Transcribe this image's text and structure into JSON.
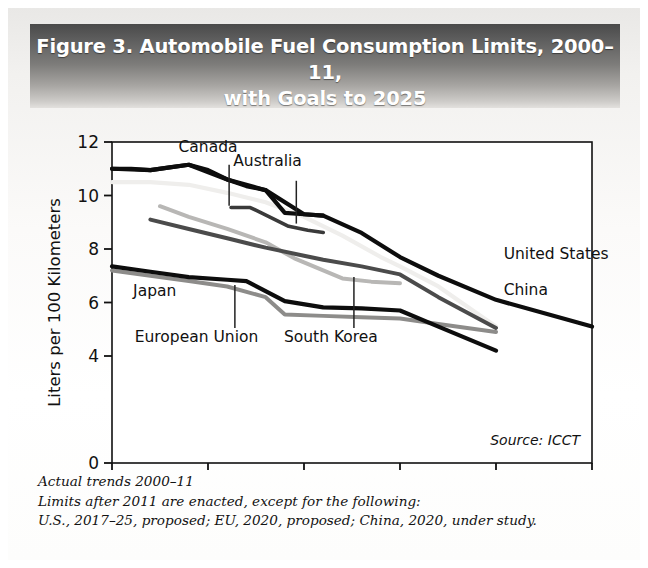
{
  "figure": {
    "title_line1": "Figure 3. Automobile Fuel Consumption Limits, 2000–11,",
    "title_line2": "with Goals to 2025",
    "source": "Source: ICCT",
    "notes": [
      "Actual trends 2000–11",
      "Limits after 2011 are enacted, except for the following:",
      "U.S., 2017–25, proposed; EU, 2020, proposed; China, 2020, under study."
    ]
  },
  "chart_data": {
    "type": "line",
    "title": "Figure 3. Automobile Fuel Consumption Limits, 2000–11, with Goals to 2025",
    "xlabel": "",
    "ylabel": "Liters per 100 Kilometers",
    "xlim": [
      2000,
      2025
    ],
    "ylim": [
      0,
      12
    ],
    "xticks": [
      2000,
      2005,
      2010,
      2015,
      2020,
      2025
    ],
    "xtick_labels": [
      "2000",
      "2005",
      "2010",
      "2015",
      "2020",
      "2025"
    ],
    "yticks": [
      0,
      4,
      6,
      8,
      10,
      12
    ],
    "ytick_labels": [
      "0",
      "4",
      "6",
      "8",
      "10",
      "12"
    ],
    "grid": false,
    "legend": "inline-labels",
    "series": [
      {
        "name": "Canada",
        "color": "#0d0d0d",
        "width": 4.2,
        "label_x": 2005.0,
        "label_y": 11.62,
        "leader": [
          2006.1,
          11.15,
          2006.1,
          9.62
        ],
        "x": [
          2000,
          2001,
          2002,
          2003,
          2004,
          2005,
          2006,
          2007,
          2008,
          2009,
          2010,
          2011
        ],
        "y": [
          11.0,
          11.0,
          10.95,
          11.05,
          11.15,
          10.95,
          10.6,
          10.35,
          10.2,
          9.35,
          9.3,
          9.25
        ]
      },
      {
        "name": "United States",
        "color": "#0d0d0d",
        "width": 4.2,
        "label_x": 2020.4,
        "label_y": 7.62,
        "leader": null,
        "x": [
          2000,
          2002,
          2004,
          2006,
          2008,
          2010,
          2011,
          2013,
          2015,
          2017,
          2020,
          2025
        ],
        "y": [
          11.0,
          10.95,
          11.15,
          10.6,
          10.2,
          9.3,
          9.25,
          8.6,
          7.7,
          7.0,
          6.1,
          5.1
        ]
      },
      {
        "name": "Australia",
        "color": "#efeeec",
        "width": 4.2,
        "label_x": 2008.1,
        "label_y": 11.1,
        "leader": [
          2009.6,
          10.55,
          2009.6,
          8.95
        ],
        "x": [
          2000,
          2002,
          2004,
          2006,
          2008,
          2010,
          2012,
          2014,
          2015,
          2017,
          2019,
          2020
        ],
        "y": [
          10.5,
          10.5,
          10.4,
          10.1,
          9.75,
          9.2,
          8.5,
          7.7,
          7.35,
          6.6,
          5.6,
          5.1
        ]
      },
      {
        "name": "Australia-actual",
        "color": "#3a3a3a",
        "width": 3.6,
        "label_x": null,
        "label_y": null,
        "leader": null,
        "x": [
          2006.2,
          2007.2,
          2008.2,
          2009.2,
          2010.2,
          2011.0
        ],
        "y": [
          9.55,
          9.55,
          9.2,
          8.85,
          8.7,
          8.62
        ]
      },
      {
        "name": "China",
        "color": "#4b4b4b",
        "width": 4.0,
        "label_x": 2020.4,
        "label_y": 6.28,
        "leader": null,
        "x": [
          2002,
          2004,
          2006,
          2008,
          2010,
          2011,
          2013,
          2015,
          2017,
          2020
        ],
        "y": [
          9.1,
          8.75,
          8.4,
          8.05,
          7.75,
          7.6,
          7.35,
          7.05,
          6.2,
          5.05
        ]
      },
      {
        "name": "South Korea",
        "color": "#b8b7b5",
        "width": 4.0,
        "label_x": 2011.4,
        "label_y": 4.52,
        "leader": [
          2012.6,
          5.05,
          2012.6,
          6.95
        ],
        "x": [
          2002.5,
          2004,
          2006,
          2008,
          2009.5,
          2011,
          2012,
          2013.5,
          2015
        ],
        "y": [
          9.6,
          9.2,
          8.75,
          8.25,
          7.65,
          7.2,
          6.9,
          6.78,
          6.72
        ]
      },
      {
        "name": "Japan",
        "color": "#0d0d0d",
        "width": 4.2,
        "label_x": 2001.1,
        "label_y": 6.25,
        "leader": null,
        "x": [
          2000,
          2002,
          2004,
          2006,
          2007,
          2009,
          2011,
          2013,
          2015,
          2017,
          2020
        ],
        "y": [
          7.35,
          7.15,
          6.95,
          6.85,
          6.8,
          6.05,
          5.82,
          5.78,
          5.7,
          5.1,
          4.2
        ]
      },
      {
        "name": "European Union",
        "color": "#8d8c8a",
        "width": 4.0,
        "label_x": 2004.4,
        "label_y": 4.52,
        "leader": [
          2006.4,
          5.05,
          2006.4,
          6.65
        ],
        "x": [
          2000,
          2002,
          2004,
          2006,
          2008,
          2009,
          2011,
          2013,
          2015,
          2017,
          2020
        ],
        "y": [
          7.2,
          7.0,
          6.8,
          6.6,
          6.2,
          5.55,
          5.5,
          5.45,
          5.4,
          5.2,
          4.9
        ]
      }
    ],
    "labels": [
      {
        "name": "Canada"
      },
      {
        "name": "Australia"
      },
      {
        "name": "United States"
      },
      {
        "name": "China"
      },
      {
        "name": "Japan"
      },
      {
        "name": "European Union"
      },
      {
        "name": "South Korea"
      }
    ]
  }
}
